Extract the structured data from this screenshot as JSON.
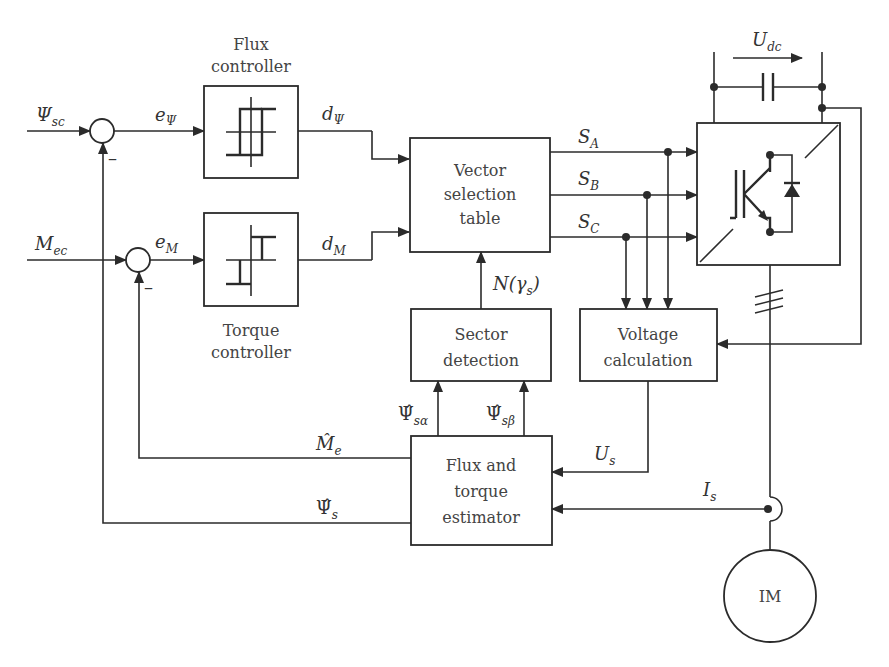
{
  "diagram": {
    "type": "block-diagram"
  },
  "blocks": {
    "flux_controller": {
      "line1": "Flux",
      "line2": "controller"
    },
    "torque_controller": {
      "line1": "Torque",
      "line2": "controller"
    },
    "vector_table": {
      "line1": "Vector",
      "line2": "selection",
      "line3": "table"
    },
    "sector_detection": {
      "line1": "Sector",
      "line2": "detection"
    },
    "voltage_calc": {
      "line1": "Voltage",
      "line2": "calculation"
    },
    "estimator": {
      "line1": "Flux and",
      "line2": "torque",
      "line3": "estimator"
    },
    "motor": {
      "label": "IM"
    }
  },
  "signals": {
    "psi_sc": {
      "main": "Ψ",
      "sub": "sc"
    },
    "m_ec": {
      "main": "M",
      "sub": "ec"
    },
    "e_psi": {
      "main": "e",
      "sub": "Ψ"
    },
    "e_m": {
      "main": "e",
      "sub": "M"
    },
    "d_psi": {
      "main": "d",
      "sub": "Ψ"
    },
    "d_m": {
      "main": "d",
      "sub": "M"
    },
    "s_a": {
      "main": "S",
      "sub": "A"
    },
    "s_b": {
      "main": "S",
      "sub": "B"
    },
    "s_c": {
      "main": "S",
      "sub": "C"
    },
    "n_gamma": {
      "text": "N(γ",
      "sub": "s",
      "close": ")"
    },
    "u_dc": {
      "main": "U",
      "sub": "dc"
    },
    "u_s": {
      "main": "U",
      "sub": "s"
    },
    "i_s": {
      "main": "I",
      "sub": "s"
    },
    "psi_s_alpha": {
      "main": "Ψ̂",
      "sub": "sα"
    },
    "psi_s_beta": {
      "main": "Ψ̂",
      "sub": "sβ"
    },
    "m_e_hat": {
      "main": "M̂",
      "sub": "e"
    },
    "psi_s_hat": {
      "main": "Ψ̂",
      "sub": "s"
    },
    "minus_sign": "–"
  }
}
